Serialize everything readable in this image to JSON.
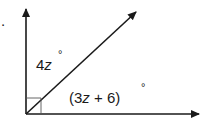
{
  "diagram": {
    "type": "angle-diagram",
    "problem_marker": ".",
    "right_angle_marker": true,
    "angles": [
      {
        "id": "upper",
        "label_coef": "4",
        "label_var": "z",
        "label_degree": "°",
        "expression": "4z°"
      },
      {
        "id": "lower",
        "label_open": "(3",
        "label_var": "z",
        "label_rest": " + 6)",
        "label_degree": "°",
        "expression": "(3z + 6)°"
      }
    ],
    "rays": [
      "vertical-up",
      "diagonal",
      "horizontal-right"
    ],
    "colors": {
      "stroke": "#1a1a1a",
      "marker": "#555555",
      "background": "#ffffff"
    }
  }
}
